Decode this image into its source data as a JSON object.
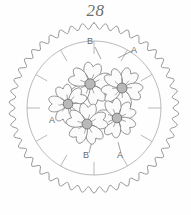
{
  "figure": {
    "number": "28",
    "kind": "circular-floral-embroidery-pattern-diagram"
  },
  "colors": {
    "background": "#fefefe",
    "outline": "#8a8a8a",
    "guide_line": "#a8a8a8",
    "flower_outline": "#7a7a7a",
    "flower_petal_fill": "#fbfbfb",
    "flower_center_fill": "#b9b9b9",
    "flower_center_stroke": "#6e6e6e",
    "label_text": "#6a6a6a",
    "title_text": "#6f6f6f",
    "leader_line": "#7a7a7a"
  },
  "geometry": {
    "center_x": 94,
    "center_y": 86,
    "scalloped_outer_radius": 85,
    "scalloped_inner_radius": 79,
    "scallop_count": 46,
    "guide_circle_radius": 67,
    "tick_count": 12,
    "tick_length": 13
  },
  "labels": [
    {
      "id": "label-b-top",
      "text": "B",
      "x": 90,
      "y": 22,
      "leader": [
        95,
        25,
        101,
        37
      ]
    },
    {
      "id": "label-a-right",
      "text": "A",
      "x": 134,
      "y": 31,
      "leader": [
        132,
        29,
        118,
        36
      ]
    },
    {
      "id": "label-a-left",
      "text": "A",
      "x": 52,
      "y": 101,
      "leader": [
        58,
        98,
        70,
        93
      ]
    },
    {
      "id": "label-b-bottom",
      "text": "B",
      "x": 86,
      "y": 136,
      "leader": [
        89,
        131,
        92,
        119
      ]
    },
    {
      "id": "label-a-bottom",
      "text": "A",
      "x": 120,
      "y": 136,
      "leader": [
        121,
        131,
        118,
        120
      ]
    }
  ],
  "flowers": [
    {
      "id": "flower-top-center",
      "cx": 90,
      "cy": 62,
      "r_petal": 21,
      "r_center": 5.2,
      "rotation": 10,
      "petals": 5
    },
    {
      "id": "flower-top-right",
      "cx": 122,
      "cy": 66,
      "r_petal": 20,
      "r_center": 5.0,
      "rotation": 32,
      "petals": 5
    },
    {
      "id": "flower-left",
      "cx": 68,
      "cy": 82,
      "r_petal": 19,
      "r_center": 4.8,
      "rotation": -18,
      "petals": 5
    },
    {
      "id": "flower-bottom-right",
      "cx": 117,
      "cy": 96,
      "r_petal": 19,
      "r_center": 4.8,
      "rotation": 55,
      "petals": 5
    },
    {
      "id": "flower-bottom-center",
      "cx": 87,
      "cy": 102,
      "r_petal": 20,
      "r_center": 5.0,
      "rotation": 4,
      "petals": 5
    }
  ]
}
